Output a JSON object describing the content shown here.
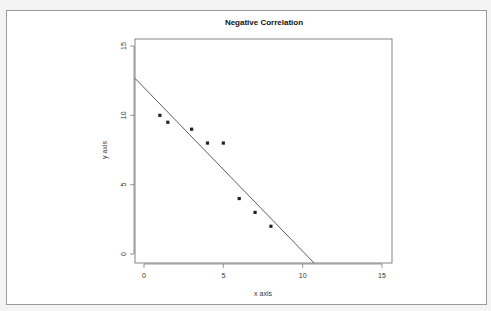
{
  "chart_data": {
    "type": "scatter",
    "title": "Negative Correlation",
    "xlabel": "x axis",
    "ylabel": "y axis",
    "xlim": [
      -0.6,
      15.5
    ],
    "ylim": [
      -0.6,
      15.7
    ],
    "xticks": [
      0,
      5,
      10,
      15
    ],
    "yticks": [
      0,
      5,
      10,
      15
    ],
    "grid": false,
    "legend": null,
    "series": [
      {
        "name": "points",
        "x": [
          1,
          1.5,
          3,
          4,
          5,
          6,
          7,
          8
        ],
        "y": [
          10,
          9.5,
          9,
          8,
          8,
          4,
          3,
          2
        ]
      }
    ],
    "fit_line": {
      "intercept": 12.0,
      "slope": -1.18
    },
    "colors": {
      "points": "#222222",
      "line": "#333333",
      "axis": "#555555"
    }
  }
}
